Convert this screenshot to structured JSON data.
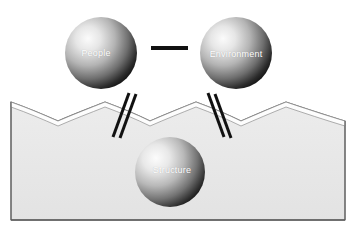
{
  "diagram": {
    "canvas": {
      "width": 356,
      "height": 238,
      "background": "#ffffff"
    },
    "nodes": [
      {
        "id": "people",
        "label": "People",
        "shape": "sphere",
        "cx": 101,
        "cy": 53,
        "r": 36,
        "label_x": 96,
        "label_y": 53,
        "gradient": {
          "light": "#f2f2f2",
          "mid": "#b9b9b9",
          "dark": "#1c1c1c"
        }
      },
      {
        "id": "environment",
        "label": "Environment",
        "shape": "sphere",
        "cx": 236,
        "cy": 53,
        "r": 36,
        "label_x": 236,
        "label_y": 54,
        "gradient": {
          "light": "#f2f2f2",
          "mid": "#b9b9b9",
          "dark": "#1c1c1c"
        }
      },
      {
        "id": "structure",
        "label": "Structure",
        "shape": "sphere",
        "cx": 170,
        "cy": 172,
        "r": 35,
        "label_x": 172,
        "label_y": 170,
        "gradient": {
          "light": "#f2f2f2",
          "mid": "#b9b9b9",
          "dark": "#1c1c1c"
        }
      }
    ],
    "connectors": [
      {
        "id": "people-environment-link",
        "style": "single-thick-horizontal",
        "color": "#111111",
        "from": "people",
        "to": "environment",
        "x1": 151,
        "y1": 48,
        "x2": 188,
        "y2": 48,
        "width": 4
      },
      {
        "id": "people-structure-link",
        "style": "double-diagonal",
        "color": "#111111",
        "from": "people",
        "to": "structure",
        "lines": [
          {
            "x1": 129,
            "y1": 93,
            "x2": 113,
            "y2": 137
          },
          {
            "x1": 136,
            "y1": 94,
            "x2": 120,
            "y2": 138
          }
        ],
        "width": 3
      },
      {
        "id": "environment-structure-link",
        "style": "double-diagonal",
        "color": "#111111",
        "from": "environment",
        "to": "structure",
        "lines": [
          {
            "x1": 208,
            "y1": 93,
            "x2": 224,
            "y2": 137
          },
          {
            "x1": 215,
            "y1": 94,
            "x2": 231,
            "y2": 138
          }
        ],
        "width": 3
      }
    ],
    "terrain": {
      "id": "ground-block",
      "fill": "#e8e8e8",
      "stroke": "#6b6b6b",
      "band_fill": "#ffffff",
      "left": 11,
      "right": 345,
      "bottom": 220,
      "peak_y": 102,
      "valley_y": 121,
      "peaks_x": [
        11,
        105,
        196,
        286
      ],
      "valleys_x": [
        58,
        150,
        241,
        345
      ],
      "outline_offset": 5,
      "description": "Wavy scalloped ground cross-section with thin surface band"
    }
  }
}
